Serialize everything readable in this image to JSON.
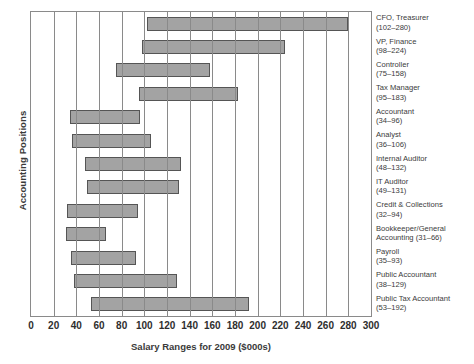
{
  "chart_data": {
    "type": "bar",
    "orientation": "horizontal",
    "subtype": "range-bar",
    "title": "",
    "xlabel": "Salary Ranges for 2009 ($000s)",
    "ylabel": "Accounting Positions",
    "xlim": [
      0,
      300
    ],
    "xticks": [
      0,
      20,
      40,
      60,
      80,
      100,
      120,
      140,
      160,
      180,
      200,
      220,
      240,
      260,
      280,
      300
    ],
    "xtick_labels": [
      "0",
      "20",
      "40",
      "60",
      "80",
      "100",
      "120",
      "140",
      "160",
      "180",
      "200",
      "220",
      "240",
      "260",
      "280",
      "300"
    ],
    "grid": "vertical",
    "legend": "none",
    "bar_fill_color": "#a3a3a3",
    "bar_edge_color": "#555555",
    "axis_color": "#8a8a8a",
    "categories": [
      "CFO, Treasurer",
      "VP, Finance",
      "Controller",
      "Tax Manager",
      "Accountant",
      "Analyst",
      "Internal Auditor",
      "IT Auditor",
      "Credit & Collections",
      "Bookkeeper/General Accounting",
      "Payroll",
      "Public Accountant",
      "Public Tax Accountant"
    ],
    "series": [
      {
        "name": "low",
        "values": [
          102,
          98,
          75,
          95,
          34,
          36,
          48,
          49,
          32,
          31,
          35,
          38,
          53
        ]
      },
      {
        "name": "high",
        "values": [
          280,
          224,
          158,
          183,
          96,
          106,
          132,
          131,
          94,
          66,
          93,
          129,
          192
        ]
      }
    ],
    "bars": [
      {
        "category": "CFO, Treasurer",
        "label_line1": "CFO, Treasurer",
        "label_line2": "(102–280)",
        "low": 102,
        "high": 280
      },
      {
        "category": "VP, Finance",
        "label_line1": "VP, Finance",
        "label_line2": "(98–224)",
        "low": 98,
        "high": 224
      },
      {
        "category": "Controller",
        "label_line1": "Controller",
        "label_line2": "(75–158)",
        "low": 75,
        "high": 158
      },
      {
        "category": "Tax Manager",
        "label_line1": "Tax Manager",
        "label_line2": "(95–183)",
        "low": 95,
        "high": 183
      },
      {
        "category": "Accountant",
        "label_line1": "Accountant",
        "label_line2": "(34–96)",
        "low": 34,
        "high": 96
      },
      {
        "category": "Analyst",
        "label_line1": "Analyst",
        "label_line2": "(36–106)",
        "low": 36,
        "high": 106
      },
      {
        "category": "Internal Auditor",
        "label_line1": "Internal Auditor",
        "label_line2": "(48–132)",
        "low": 48,
        "high": 132
      },
      {
        "category": "IT Auditor",
        "label_line1": "IT Auditor",
        "label_line2": "(49–131)",
        "low": 49,
        "high": 131
      },
      {
        "category": "Credit & Collections",
        "label_line1": "Credit & Collections",
        "label_line2": "(32–94)",
        "low": 32,
        "high": 94
      },
      {
        "category": "Bookkeeper/General Accounting",
        "label_line1": "Bookkeeper/General",
        "label_line2": "Accounting (31–66)",
        "low": 31,
        "high": 66
      },
      {
        "category": "Payroll",
        "label_line1": "Payroll",
        "label_line2": "(35–93)",
        "low": 35,
        "high": 93
      },
      {
        "category": "Public Accountant",
        "label_line1": "Public Accountant",
        "label_line2": "(38–129)",
        "low": 38,
        "high": 129
      },
      {
        "category": "Public Tax Accountant",
        "label_line1": "Public Tax Accountant",
        "label_line2": "(53–192)",
        "low": 53,
        "high": 192
      }
    ]
  }
}
